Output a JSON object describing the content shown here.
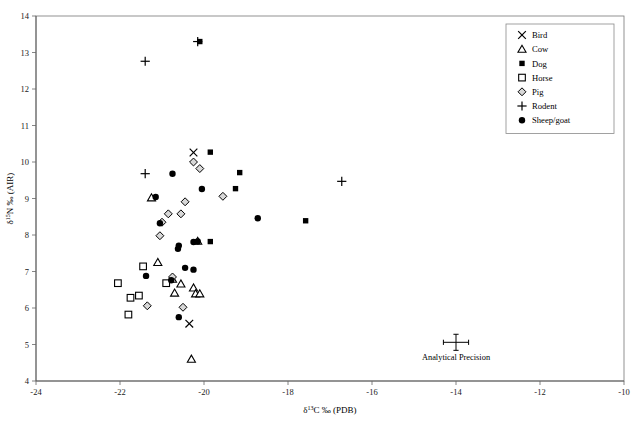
{
  "chart_data": {
    "type": "scatter",
    "title": "",
    "xlabel": "δ¹³C ‰ (PDB)",
    "ylabel": "δ¹⁵N ‰ (AIR)",
    "xlabel_parts": {
      "delta": "δ",
      "sup": "13",
      "rest": "C ‰ (PDB)"
    },
    "ylabel_parts": {
      "delta": "δ",
      "sup": "15",
      "rest": "N ‰ (AIR)"
    },
    "xlim": [
      -24,
      -10
    ],
    "ylim": [
      4,
      14
    ],
    "xticks": [
      -24,
      -22,
      -20,
      -18,
      -16,
      -14,
      -12,
      -10
    ],
    "yticks": [
      4,
      5,
      6,
      7,
      8,
      9,
      10,
      11,
      12,
      13,
      14
    ],
    "xticklabels": [
      "-24",
      "-22",
      "-20",
      "-18",
      "-16",
      "-14",
      "-12",
      "-10"
    ],
    "yticklabels": [
      "4",
      "5",
      "6",
      "7",
      "8",
      "9",
      "10",
      "11",
      "12",
      "13",
      "14"
    ],
    "grid": false,
    "legend_position": "top-right",
    "series": [
      {
        "name": "Bird",
        "marker": "x-cross",
        "points": [
          {
            "x": -20.25,
            "y": 10.26
          },
          {
            "x": -20.35,
            "y": 5.57
          }
        ]
      },
      {
        "name": "Cow",
        "marker": "open-triangle",
        "points": [
          {
            "x": -21.25,
            "y": 9.02
          },
          {
            "x": -21.1,
            "y": 7.25
          },
          {
            "x": -20.15,
            "y": 7.83
          },
          {
            "x": -20.75,
            "y": 6.79
          },
          {
            "x": -20.55,
            "y": 6.66
          },
          {
            "x": -20.7,
            "y": 6.41
          },
          {
            "x": -20.25,
            "y": 6.55
          },
          {
            "x": -20.2,
            "y": 6.39
          },
          {
            "x": -20.1,
            "y": 6.39
          },
          {
            "x": -20.3,
            "y": 4.6
          }
        ]
      },
      {
        "name": "Dog",
        "marker": "filled-square",
        "points": [
          {
            "x": -20.1,
            "y": 13.3
          },
          {
            "x": -19.85,
            "y": 10.27
          },
          {
            "x": -19.15,
            "y": 9.71
          },
          {
            "x": -19.25,
            "y": 9.27
          },
          {
            "x": -19.85,
            "y": 7.82
          },
          {
            "x": -17.58,
            "y": 8.39
          }
        ]
      },
      {
        "name": "Horse",
        "marker": "open-square",
        "points": [
          {
            "x": -22.05,
            "y": 6.68
          },
          {
            "x": -21.75,
            "y": 6.28
          },
          {
            "x": -21.55,
            "y": 6.34
          },
          {
            "x": -21.45,
            "y": 7.14
          },
          {
            "x": -21.8,
            "y": 5.82
          },
          {
            "x": -20.9,
            "y": 6.68
          }
        ]
      },
      {
        "name": "Pig",
        "marker": "open-diamond",
        "points": [
          {
            "x": -20.1,
            "y": 9.82
          },
          {
            "x": -19.55,
            "y": 9.06
          },
          {
            "x": -20.45,
            "y": 8.91
          },
          {
            "x": -20.55,
            "y": 8.58
          },
          {
            "x": -20.85,
            "y": 8.58
          },
          {
            "x": -21.0,
            "y": 8.35
          },
          {
            "x": -21.05,
            "y": 7.98
          },
          {
            "x": -20.25,
            "y": 10.0
          },
          {
            "x": -20.75,
            "y": 6.85
          },
          {
            "x": -20.5,
            "y": 6.02
          },
          {
            "x": -21.35,
            "y": 6.06
          }
        ]
      },
      {
        "name": "Rodent",
        "marker": "plus-cross",
        "points": [
          {
            "x": -20.15,
            "y": 13.3
          },
          {
            "x": -21.4,
            "y": 12.76
          },
          {
            "x": -21.4,
            "y": 9.68
          },
          {
            "x": -16.72,
            "y": 9.47
          }
        ]
      },
      {
        "name": "Sheep/goat",
        "marker": "filled-circle",
        "points": [
          {
            "x": -20.75,
            "y": 9.68
          },
          {
            "x": -20.05,
            "y": 9.26
          },
          {
            "x": -21.15,
            "y": 9.04
          },
          {
            "x": -21.05,
            "y": 8.32
          },
          {
            "x": -18.72,
            "y": 8.46
          },
          {
            "x": -20.15,
            "y": 7.82
          },
          {
            "x": -20.25,
            "y": 7.81
          },
          {
            "x": -20.6,
            "y": 7.71
          },
          {
            "x": -20.62,
            "y": 7.62
          },
          {
            "x": -20.45,
            "y": 7.1
          },
          {
            "x": -20.25,
            "y": 7.05
          },
          {
            "x": -21.38,
            "y": 6.88
          },
          {
            "x": -20.78,
            "y": 6.76
          },
          {
            "x": -20.6,
            "y": 5.75
          }
        ]
      }
    ],
    "annotations": [
      {
        "name": "analytical-precision",
        "label": "Analytical Precision",
        "x": -14.0,
        "y": 5.06,
        "x_error": 0.3,
        "y_error": 0.22
      }
    ]
  },
  "legend": {
    "items": [
      {
        "label": "Bird",
        "marker": "x-cross"
      },
      {
        "label": "Cow",
        "marker": "open-triangle"
      },
      {
        "label": "Dog",
        "marker": "filled-square"
      },
      {
        "label": "Horse",
        "marker": "open-square"
      },
      {
        "label": "Pig",
        "marker": "open-diamond"
      },
      {
        "label": "Rodent",
        "marker": "plus-cross"
      },
      {
        "label": "Sheep/goat",
        "marker": "filled-circle"
      }
    ]
  },
  "colors": {
    "marker": "#000000",
    "pig_fill": "#d8d8d8",
    "axis": "#555555",
    "frame": "#777777",
    "background": "#ffffff"
  }
}
